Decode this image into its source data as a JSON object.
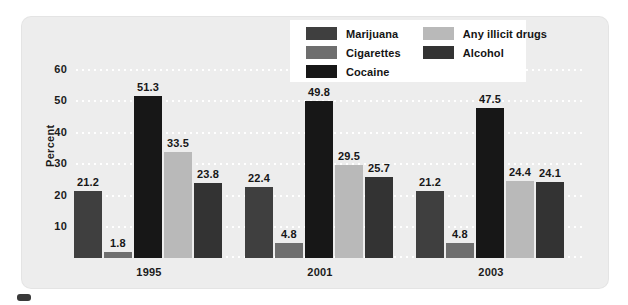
{
  "chart_data": {
    "type": "bar",
    "title": "",
    "xlabel": "",
    "ylabel": "Percent",
    "ylim": [
      0,
      65
    ],
    "yticks": [
      10,
      20,
      30,
      40,
      50,
      60
    ],
    "grid": true,
    "legend_position": "top-center",
    "categories": [
      "1995",
      "2001",
      "2003"
    ],
    "series": [
      {
        "name": "Marijuana",
        "color": "#3f3f3f",
        "values": [
          21.2,
          22.4,
          21.2
        ]
      },
      {
        "name": "Cigarettes",
        "color": "#6e6e6e",
        "values": [
          1.8,
          4.8,
          4.8
        ]
      },
      {
        "name": "Cocaine",
        "color": "#171717",
        "values": [
          51.3,
          49.8,
          47.5
        ]
      },
      {
        "name": "Any illicit drugs",
        "color": "#b9b9b9",
        "values": [
          33.5,
          29.5,
          24.4
        ]
      },
      {
        "name": "Alcohol",
        "color": "#333333",
        "values": [
          23.8,
          25.7,
          24.1
        ]
      }
    ]
  },
  "axes": {
    "y_title": "Percent",
    "y_ticks": [
      "60",
      "50",
      "40",
      "30",
      "20",
      "10"
    ],
    "x_ticks": [
      "1995",
      "2001",
      "2003"
    ]
  },
  "legend": {
    "column_left": [
      {
        "label": "Marijuana",
        "color": "#3f3f3f"
      },
      {
        "label": "Cigarettes",
        "color": "#6e6e6e"
      },
      {
        "label": "Cocaine",
        "color": "#171717"
      }
    ],
    "column_right": [
      {
        "label": "Any illicit drugs",
        "color": "#b9b9b9"
      },
      {
        "label": "Alcohol",
        "color": "#333333"
      }
    ]
  },
  "bar_labels": {
    "g0": [
      "21.2",
      "1.8",
      "51.3",
      "33.5",
      "23.8"
    ],
    "g1": [
      "22.4",
      "4.8",
      "49.8",
      "29.5",
      "25.7"
    ],
    "g2": [
      "21.2",
      "4.8",
      "47.5",
      "24.4",
      "24.1"
    ]
  },
  "style": {
    "panel_bg": "#ededed",
    "gridline_color": "#ffffff",
    "legend_bg": "#ffffff",
    "text_color": "#1b1b1b"
  }
}
